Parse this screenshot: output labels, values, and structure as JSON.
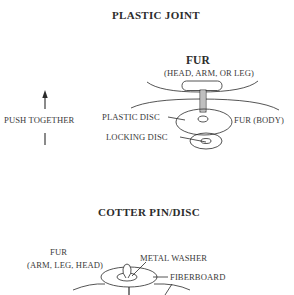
{
  "diagram": {
    "sections": [
      {
        "title": "PLASTIC JOINT",
        "labels": {
          "fur": "FUR",
          "fur_parts": "(HEAD, ARM, OR LEG)",
          "push_together": "PUSH TOGETHER",
          "plastic_disc": "PLASTIC DISC",
          "fur_body": "FUR (BODY)",
          "locking_disc": "LOCKING DISC"
        }
      },
      {
        "title": "COTTER PIN/DISC",
        "labels": {
          "fur": "FUR",
          "fur_parts": "(ARM, LEG, HEAD)",
          "metal_washer": "METAL WASHER",
          "fiberboard": "FIBERBOARD"
        }
      }
    ],
    "colors": {
      "line": "#2a2a2a",
      "text": "#3a3a3a",
      "background": "#ffffff"
    }
  }
}
